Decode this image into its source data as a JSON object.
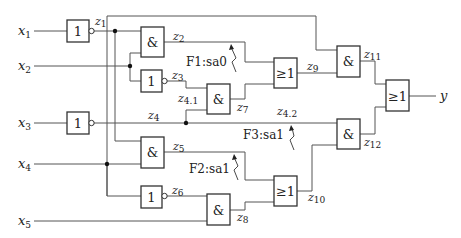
{
  "diagram": {
    "type": "logic-circuit",
    "inputs": [
      {
        "name": "x",
        "sub": "1"
      },
      {
        "name": "x",
        "sub": "2"
      },
      {
        "name": "x",
        "sub": "3"
      },
      {
        "name": "x",
        "sub": "4"
      },
      {
        "name": "x",
        "sub": "5"
      }
    ],
    "output": {
      "name": "y"
    },
    "gates": [
      {
        "id": "not1",
        "symbol": "1",
        "output": "z1",
        "inverted": true
      },
      {
        "id": "and2",
        "symbol": "&",
        "output": "z2"
      },
      {
        "id": "not3",
        "symbol": "1",
        "output": "z3",
        "inverted": true
      },
      {
        "id": "not4",
        "symbol": "1",
        "output": "z4",
        "inverted": true
      },
      {
        "id": "and5",
        "symbol": "&",
        "output": "z5"
      },
      {
        "id": "not6",
        "symbol": "1",
        "output": "z6",
        "inverted": true
      },
      {
        "id": "and7",
        "symbol": "&",
        "output": "z7"
      },
      {
        "id": "and8",
        "symbol": "&",
        "output": "z8"
      },
      {
        "id": "or9",
        "symbol": "≥1",
        "output": "z9"
      },
      {
        "id": "or10",
        "symbol": "≥1",
        "output": "z10"
      },
      {
        "id": "and11",
        "symbol": "&",
        "output": "z11"
      },
      {
        "id": "and12",
        "symbol": "&",
        "output": "z12"
      },
      {
        "id": "or13",
        "symbol": "≥1",
        "output": "y"
      }
    ],
    "signal_labels": {
      "z1": {
        "name": "z",
        "sub": "1"
      },
      "z2": {
        "name": "z",
        "sub": "2"
      },
      "z3": {
        "name": "z",
        "sub": "3"
      },
      "z4": {
        "name": "z",
        "sub": "4"
      },
      "z41": {
        "name": "z",
        "sub": "4.1"
      },
      "z42": {
        "name": "z",
        "sub": "4.2"
      },
      "z5": {
        "name": "z",
        "sub": "5"
      },
      "z6": {
        "name": "z",
        "sub": "6"
      },
      "z7": {
        "name": "z",
        "sub": "7"
      },
      "z8": {
        "name": "z",
        "sub": "8"
      },
      "z9": {
        "name": "z",
        "sub": "9"
      },
      "z10": {
        "name": "z",
        "sub": "10"
      },
      "z11": {
        "name": "z",
        "sub": "11"
      },
      "z12": {
        "name": "z",
        "sub": "12"
      }
    },
    "faults": [
      {
        "id": "F1",
        "label": "F1:sa0",
        "line": "z2"
      },
      {
        "id": "F2",
        "label": "F2:sa1",
        "line": "z5"
      },
      {
        "id": "F3",
        "label": "F3:sa1",
        "line": "z4.2"
      }
    ]
  }
}
